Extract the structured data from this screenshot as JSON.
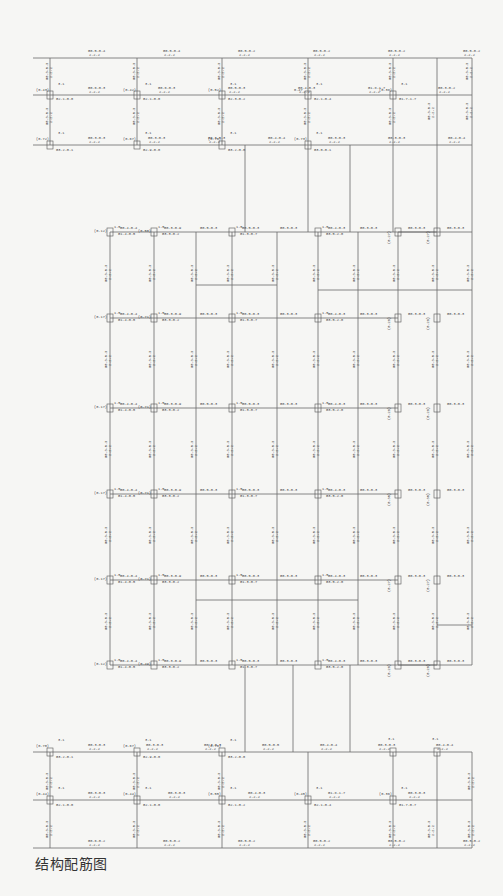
{
  "caption": "结构配筋图",
  "grid": {
    "top_block": {
      "columns_x": [
        50,
        137,
        222,
        308,
        393,
        437,
        472
      ],
      "rows_y": [
        58,
        95,
        145
      ],
      "column_ratios_row1": [
        "(0.43)",
        "(0.42)",
        "(0.52)",
        "0.47",
        "(0.38)"
      ],
      "column_ratios_row2": [
        "(0.72)",
        "(0.67)",
        "(0.76)",
        "(0.73)"
      ],
      "node_tag": "3.1",
      "column_codes_row1": [
        "G2.1-0.0",
        "G2.1-0.0",
        "G2.3-0.2",
        "G2.1-0.4",
        "G1.7-1.7"
      ],
      "column_codes_row2": [
        "G3.2-0.1",
        "G2.9-0.0",
        "G3.2-0.0",
        "G3.0-0.1"
      ],
      "beam_labels_top": [
        "G0.5-0.4",
        "G0.5-0.4",
        "G0.5-0.2",
        "G0.5-0.2",
        "G0.5-0.2",
        "G0.5-0.2"
      ],
      "beam_labels_row1": [
        "G0.6-0.3",
        "G0.6-0.3",
        "G0.5-0.3",
        "G0.4-0.3",
        "G1.8-1.7",
        "G0.3-0.2"
      ],
      "beam_labels_row2": [
        "G0.3-0.3",
        "G0.3-0.3",
        "G0.3-0.3",
        "G0.4-0.4",
        "G0.3-0.3",
        "G0.3-0.3",
        "G0.4-0.4"
      ]
    },
    "middle_block": {
      "columns_x": [
        110,
        154,
        196,
        232,
        277,
        318,
        358,
        398,
        437,
        472
      ],
      "rows_y": [
        232,
        318,
        408,
        494,
        580,
        665
      ],
      "row_ratios_left": [
        "(0.12)",
        "(0.17)",
        "(0.17)",
        "(0.17)",
        "(0.17)",
        "(0.12)"
      ],
      "row_ratios_second": [
        "(0.50)",
        "(0.71)",
        "(0.71)",
        "(0.71)",
        "(0.71)",
        "(0.49)"
      ],
      "node_tag": "1.5",
      "beam_labels": [
        "G0.4-0.4",
        "G0.3-0.9",
        "G0.5-0.3",
        "G0.4-0.3",
        "G0.3-0.3",
        "G0.2-0.2"
      ],
      "column_codes": [
        "G1.4-0.5",
        "G3.3-0.2",
        "G1.3-0.7",
        "G3.5-2.0"
      ],
      "side_ratios": [
        "(0.27)",
        "(0.28)",
        "(0.28)",
        "(0.30)"
      ]
    },
    "bottom_block": {
      "columns_x": [
        50,
        137,
        222,
        308,
        393,
        437,
        472
      ],
      "rows_y": [
        752,
        800,
        848
      ],
      "column_ratios_row1": [
        "(0.70)",
        "(0.67)",
        "(0.76)"
      ],
      "column_ratios_row2": [
        "(0.44)",
        "(0.44)",
        "(0.55)",
        "(0.45)",
        "(0.36)"
      ],
      "node_tag": "3.1",
      "column_codes_row1": [
        "G3.2-0.1",
        "G2.9-0.0",
        "G3.2-0.0"
      ],
      "column_codes_row2": [
        "G2.1-0.0",
        "G2.1-0.0",
        "G2.1-0.2",
        "G2.1-0.4",
        "G1.7-0.7"
      ],
      "beam_labels_row1": [
        "G0.3-0.3",
        "G0.3-0.3",
        "G0.3-0.3",
        "G0.5-0.5",
        "G0.4-0.4",
        "G0.3-0.3",
        "G0.4-0.4"
      ],
      "beam_labels_row2": [
        "G0.3-0.3",
        "G0.3-0.3",
        "G0.4-0.3",
        "G1.8-1.7",
        "G0.3-0.3"
      ],
      "beam_labels_bottom": [
        "G0.6-0.2",
        "G0.5-0.2",
        "G0.5-0.2",
        "G0.5-0.2",
        "G0.5-0.2",
        "G0.5-0.2"
      ]
    }
  }
}
